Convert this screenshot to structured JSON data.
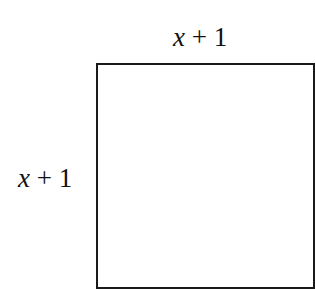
{
  "diagram": {
    "shape": "square",
    "side_labels": {
      "top": {
        "variable": "x",
        "operator": " + ",
        "constant": "1"
      },
      "left": {
        "variable": "x",
        "operator": " + ",
        "constant": "1"
      }
    },
    "colors": {
      "stroke": "#1a1a1a",
      "fill": "#ffffff",
      "text": "#111111"
    }
  }
}
